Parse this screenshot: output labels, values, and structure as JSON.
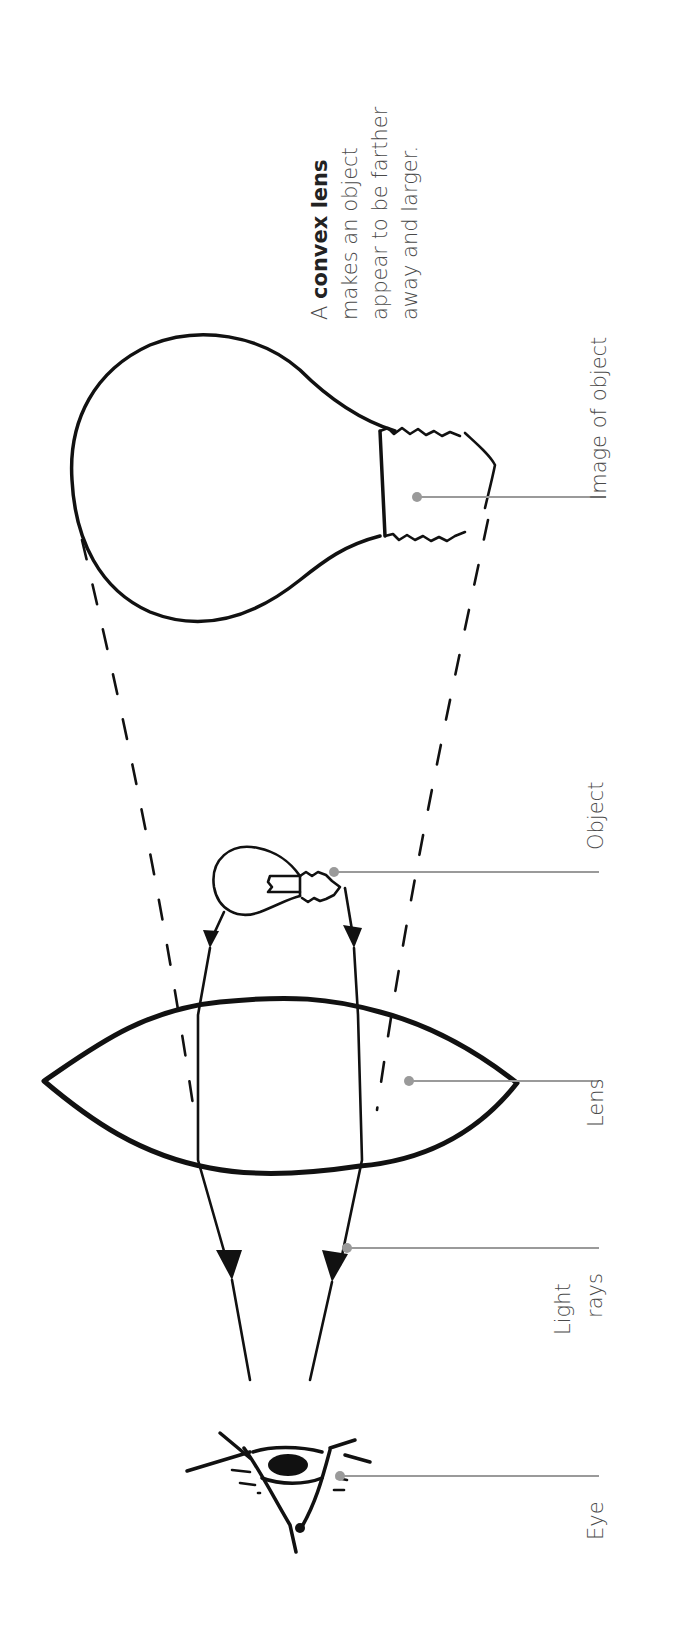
{
  "figure": {
    "orientation": "rotated 90 degrees counter-clockwise (text reads bottom-to-top)",
    "caption": {
      "prefix": "A ",
      "bold": "convex lens",
      "line2": "makes an object",
      "line3": "appear to be farther",
      "line4": "away and larger."
    },
    "labels": {
      "image_of_object": "Image of object",
      "object": "Object",
      "lens": "Lens",
      "light_rays_line1": "Light",
      "light_rays_line2": "rays",
      "eye": "Eye"
    },
    "colors": {
      "ink": "#111111",
      "leader": "#9a9a9a",
      "label_text": "#4a4a4a",
      "background": "#ffffff"
    }
  }
}
